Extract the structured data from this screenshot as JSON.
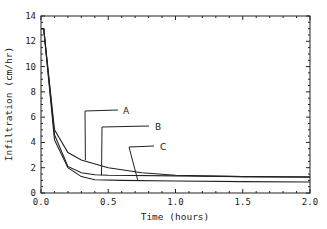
{
  "chart_data": {
    "type": "line",
    "title": "",
    "xlabel": "Time (hours)",
    "ylabel": "Infiltration (cm/hr)",
    "xlim": [
      0,
      2.0
    ],
    "ylim": [
      0,
      14
    ],
    "xticks": [
      "0.0",
      "0.5",
      "1.0",
      "1.5",
      "2.0"
    ],
    "yticks": [
      "0",
      "2",
      "4",
      "6",
      "8",
      "10",
      "12",
      "14"
    ],
    "grid": false,
    "legend": "annotated labels with leader lines",
    "series": [
      {
        "name": "A",
        "x": [
          0.0,
          0.02,
          0.1,
          0.2,
          0.3,
          0.5,
          0.75,
          1.0,
          1.5,
          2.0
        ],
        "y": [
          13.0,
          13.0,
          5.0,
          3.2,
          2.6,
          2.0,
          1.6,
          1.4,
          1.3,
          1.25
        ]
      },
      {
        "name": "B",
        "x": [
          0.0,
          0.02,
          0.1,
          0.2,
          0.3,
          0.4,
          0.5,
          1.0,
          1.5,
          2.0
        ],
        "y": [
          13.0,
          13.0,
          4.6,
          2.1,
          1.6,
          1.45,
          1.4,
          1.35,
          1.3,
          1.27
        ]
      },
      {
        "name": "C",
        "x": [
          0.0,
          0.02,
          0.1,
          0.2,
          0.3,
          0.4,
          0.6,
          1.0,
          1.5,
          2.0
        ],
        "y": [
          13.0,
          13.0,
          4.2,
          2.0,
          1.3,
          1.05,
          1.0,
          0.95,
          0.9,
          0.87
        ]
      }
    ],
    "annotations": [
      {
        "text": "A",
        "points_to": [
          0.33,
          2.6
        ]
      },
      {
        "text": "B",
        "points_to": [
          0.45,
          1.4
        ]
      },
      {
        "text": "C",
        "points_to": [
          0.72,
          1.0
        ]
      }
    ]
  }
}
